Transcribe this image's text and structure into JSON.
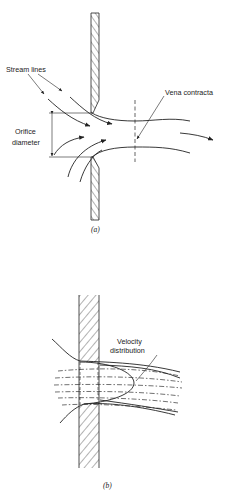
{
  "figure_a": {
    "caption": "(a)",
    "labels": {
      "stream_lines": "Stream lines",
      "vena_contracta": "Vena contracta",
      "orifice_line1": "Orifice",
      "orifice_line2": "diameter"
    }
  },
  "figure_b": {
    "caption": "(b)",
    "labels": {
      "velocity_line1": "Velocity",
      "velocity_line2": "distribution"
    }
  },
  "colors": {
    "ink": "#222222",
    "background": "#ffffff"
  }
}
